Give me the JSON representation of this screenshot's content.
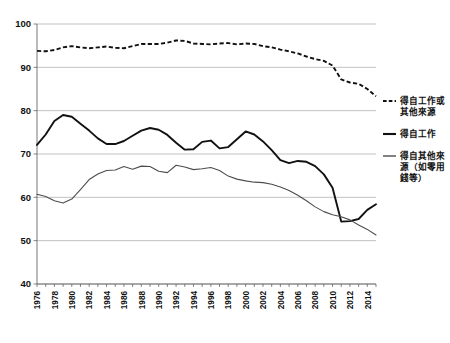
{
  "chart_data": {
    "type": "line",
    "title": "",
    "subtitle": "",
    "xlabel": "",
    "ylabel": "",
    "xlim": [
      1976,
      2015
    ],
    "ylim": [
      40,
      100
    ],
    "yticks": [
      40,
      50,
      60,
      70,
      80,
      90,
      100
    ],
    "grid": true,
    "legend_position": "right",
    "x": [
      1976,
      1977,
      1978,
      1979,
      1980,
      1981,
      1982,
      1983,
      1984,
      1985,
      1986,
      1987,
      1988,
      1989,
      1990,
      1991,
      1992,
      1993,
      1994,
      1995,
      1996,
      1997,
      1998,
      1999,
      2000,
      2001,
      2002,
      2003,
      2004,
      2005,
      2006,
      2007,
      2008,
      2009,
      2010,
      2011,
      2012,
      2013,
      2014,
      2015
    ],
    "xticks": [
      1976,
      1978,
      1980,
      1982,
      1984,
      1986,
      1988,
      1990,
      1992,
      1994,
      1996,
      1998,
      2000,
      2002,
      2004,
      2006,
      2008,
      2010,
      2012,
      2014
    ],
    "xtick_labels": [
      "1976",
      "1978",
      "1980",
      "1982",
      "1984",
      "1986",
      "1988",
      "1990",
      "1992",
      "1994",
      "1996",
      "1998",
      "2000",
      "2002",
      "2004",
      "2006",
      "2008",
      "2010",
      "2012",
      "2014"
    ],
    "series": [
      {
        "name": "得自工作或其他來源",
        "style": "dashed",
        "color": "#111111",
        "values": [
          93.8,
          93.7,
          94.0,
          94.6,
          94.9,
          94.6,
          94.4,
          94.6,
          94.8,
          94.5,
          94.4,
          94.9,
          95.4,
          95.4,
          95.4,
          95.7,
          96.2,
          96.1,
          95.5,
          95.4,
          95.3,
          95.5,
          95.6,
          95.3,
          95.5,
          95.4,
          94.9,
          94.6,
          94.1,
          93.7,
          93.2,
          92.5,
          91.9,
          91.5,
          90.4,
          87.2,
          86.5,
          86.2,
          85.0,
          83.3
        ]
      },
      {
        "name": "得自工作",
        "style": "solid",
        "color": "#111111",
        "values": [
          72.1,
          74.5,
          77.6,
          79.0,
          78.6,
          77.0,
          75.4,
          73.6,
          72.3,
          72.3,
          73.0,
          74.2,
          75.4,
          76.0,
          75.6,
          74.4,
          72.6,
          71.0,
          71.1,
          72.8,
          73.1,
          71.3,
          71.6,
          73.4,
          75.2,
          74.5,
          72.9,
          70.9,
          68.6,
          67.9,
          68.4,
          68.2,
          67.2,
          65.3,
          62.2,
          54.4,
          54.5,
          55.0,
          57.1,
          58.4
        ]
      },
      {
        "name": "得自其他來源（如零用錢等）",
        "style": "solid-thin",
        "color": "#4d4d4d",
        "values": [
          60.7,
          60.2,
          59.2,
          58.7,
          59.6,
          61.8,
          64.1,
          65.4,
          66.2,
          66.3,
          67.1,
          66.5,
          67.2,
          67.1,
          66.0,
          65.7,
          67.4,
          67.0,
          66.4,
          66.6,
          66.9,
          66.2,
          64.9,
          64.2,
          63.8,
          63.5,
          63.4,
          63.0,
          62.4,
          61.6,
          60.5,
          59.2,
          57.8,
          56.7,
          56.0,
          55.5,
          54.8,
          53.6,
          52.6,
          51.3
        ]
      }
    ],
    "legend": [
      {
        "label_line1": "得自工作或",
        "label_line2": "其他來源",
        "style": "dashed"
      },
      {
        "label_line1": "得自工作",
        "label_line2": "",
        "style": "solid"
      },
      {
        "label_line1": "得自其他來",
        "label_line2": "源（如零用",
        "label_line3": "錢等）",
        "style": "solid-thin"
      }
    ]
  },
  "colors": {
    "background": "#ffffff",
    "gridline": "#a8a8a8",
    "axis": "#555555",
    "series_primary": "#111111",
    "series_secondary": "#4d4d4d",
    "text": "#111111"
  }
}
